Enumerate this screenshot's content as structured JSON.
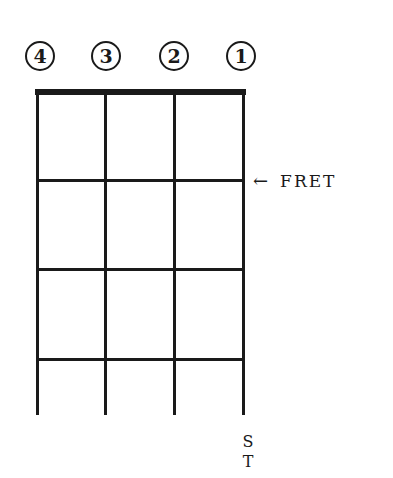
{
  "diagram": {
    "type": "ukulele-chord-grid",
    "strings": [
      {
        "label": "4",
        "x": 37
      },
      {
        "label": "3",
        "x": 105
      },
      {
        "label": "2",
        "x": 174
      },
      {
        "label": "1",
        "x": 243
      }
    ],
    "fret_lines_y": [
      180,
      269,
      359
    ],
    "annotation": {
      "arrow": "←",
      "text": "FRET"
    },
    "bottom_label": [
      "S",
      "T"
    ]
  }
}
